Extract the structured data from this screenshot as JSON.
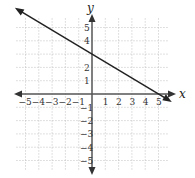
{
  "chart_data": {
    "type": "line",
    "title": "",
    "xlabel": "x",
    "ylabel": "y",
    "xlim": [
      -5.5,
      5.5
    ],
    "ylim": [
      -5.5,
      5.5
    ],
    "grid": true,
    "x_ticks": [
      "-5",
      "-4",
      "-3",
      "-2",
      "-1",
      "1",
      "2",
      "3",
      "4",
      "5"
    ],
    "y_ticks": [
      "5",
      "4",
      "2",
      "1",
      "-1",
      "-2",
      "-3",
      "-4",
      "-5"
    ],
    "series": [
      {
        "name": "line",
        "equation": "y = -3/5 x + 3",
        "points": [
          [
            -5,
            6
          ],
          [
            0,
            3
          ],
          [
            5,
            0
          ]
        ],
        "arrows_both_ends": true,
        "color": "#222222"
      }
    ]
  },
  "labels": {
    "x": "x",
    "y": "y"
  }
}
